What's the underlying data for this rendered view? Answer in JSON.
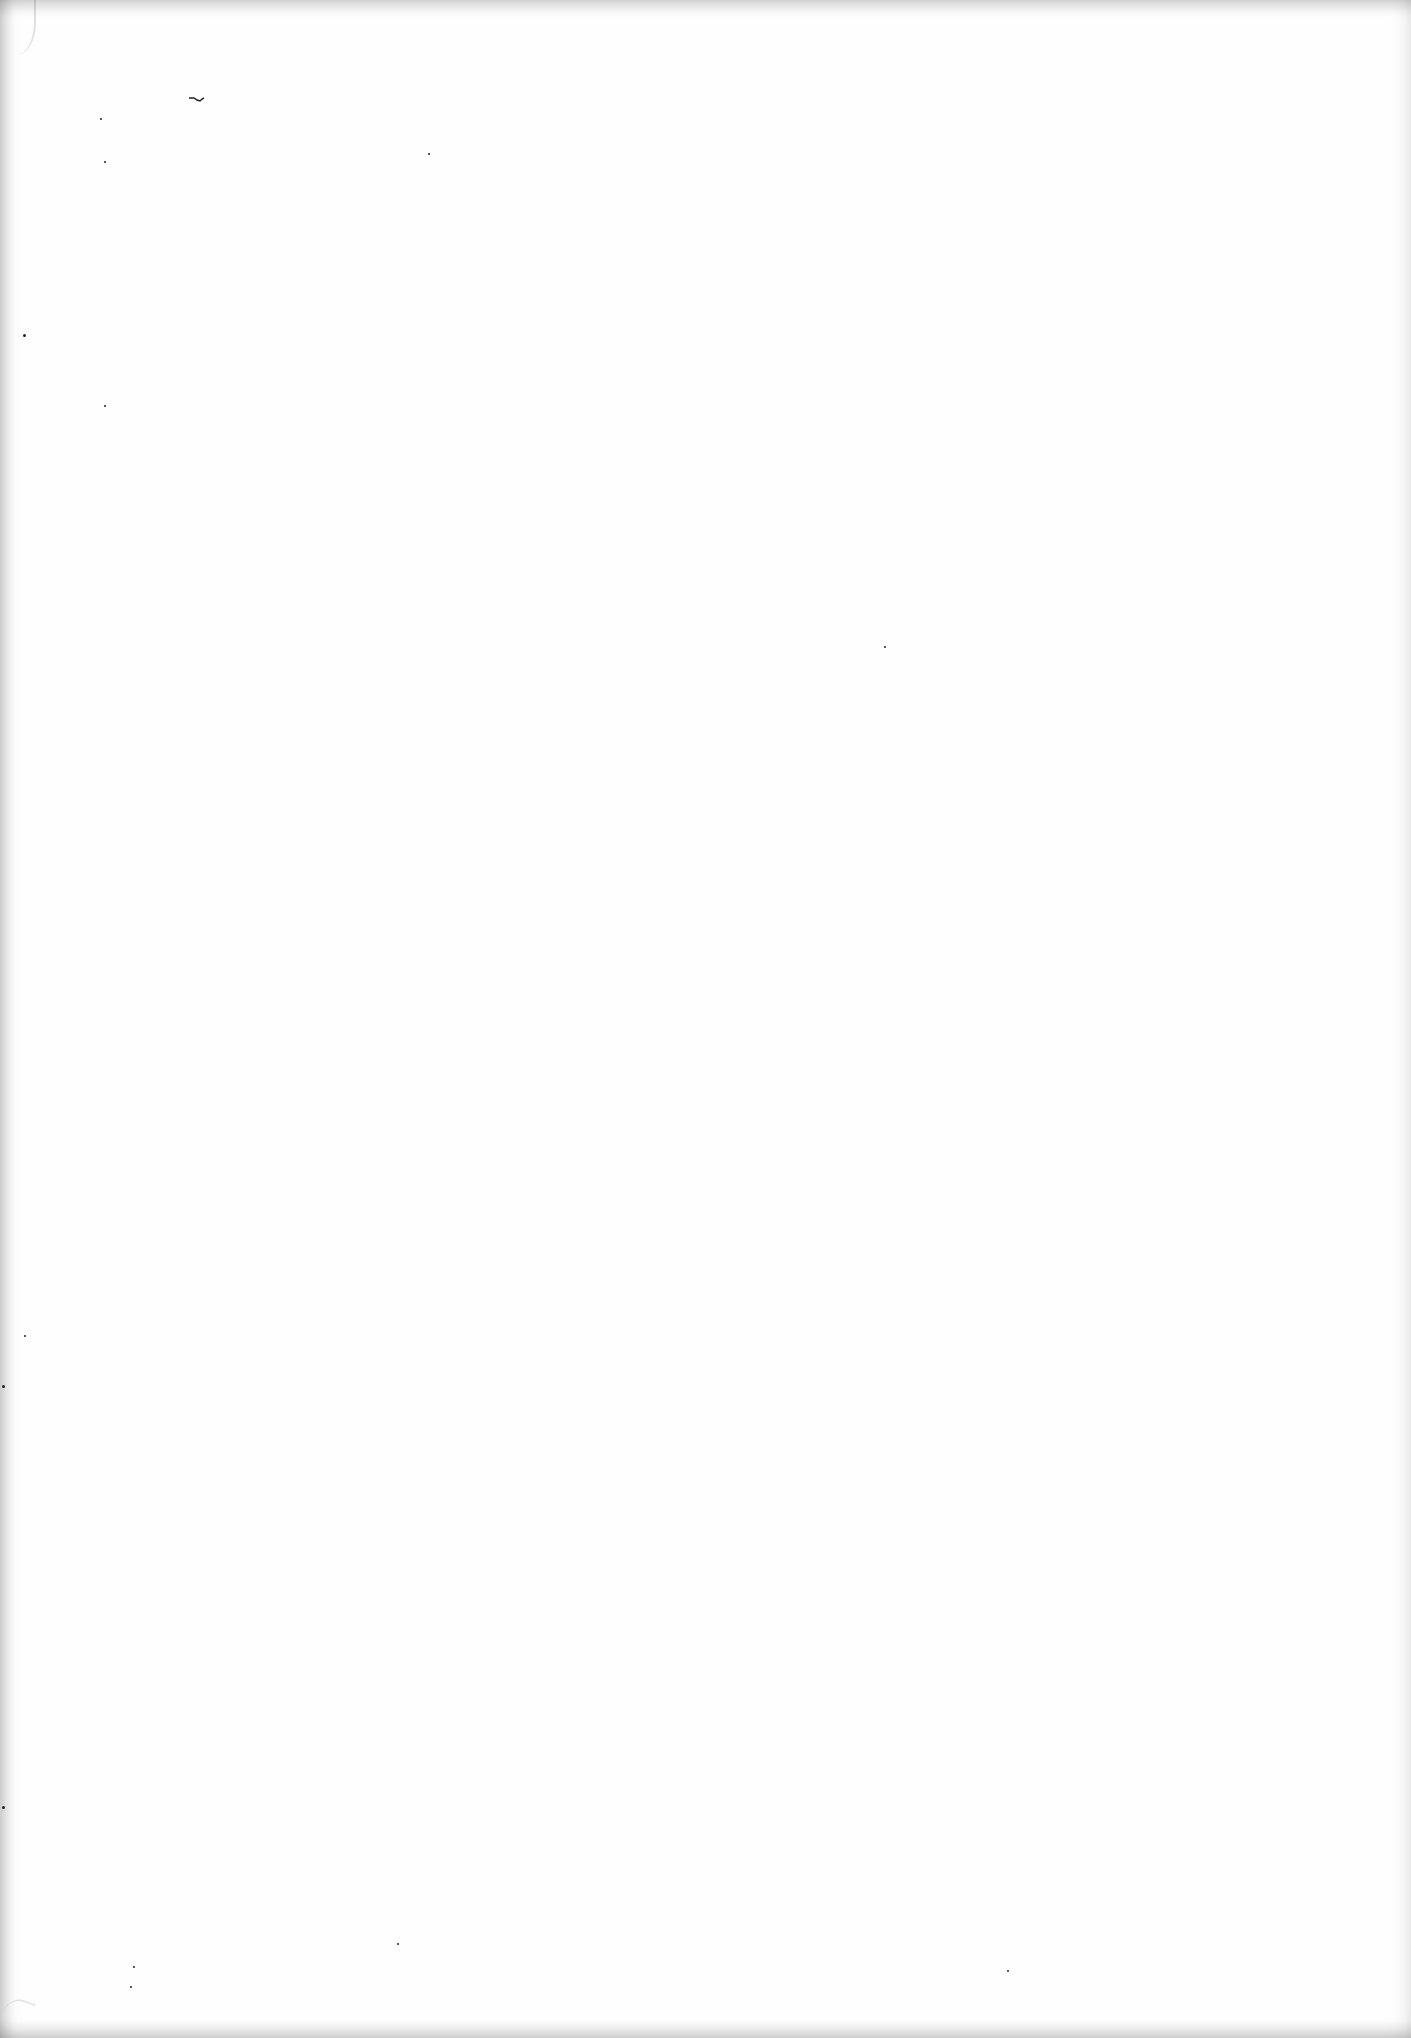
{
  "document": {
    "type": "blank scanned page",
    "text": "",
    "background_color": "#fefefe"
  },
  "marks": [
    {
      "kind": "ink-stroke",
      "glyph": "~"
    }
  ]
}
